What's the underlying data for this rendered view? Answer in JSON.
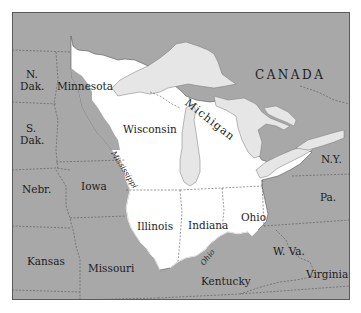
{
  "map": {
    "colors": {
      "outside_region": "#a8a8a8",
      "highlight_region": "#ffffff",
      "water": "#e6e6e6",
      "border": "#4a4a4a",
      "frame": "#5a5a5a"
    },
    "country_label": "CANADA",
    "lake_label": "Michigan",
    "highlighted_states": [
      {
        "id": "minnesota",
        "label": "Minnesota"
      },
      {
        "id": "wisconsin",
        "label": "Wisconsin"
      },
      {
        "id": "illinois",
        "label": "Illinois"
      },
      {
        "id": "indiana",
        "label": "Indiana"
      },
      {
        "id": "ohio",
        "label": "Ohio"
      }
    ],
    "other_states": [
      {
        "id": "north-dakota",
        "label_line1": "N.",
        "label_line2": "Dak."
      },
      {
        "id": "south-dakota",
        "label_line1": "S.",
        "label_line2": "Dak."
      },
      {
        "id": "nebraska",
        "label": "Nebr."
      },
      {
        "id": "iowa",
        "label": "Iowa"
      },
      {
        "id": "kansas",
        "label": "Kansas"
      },
      {
        "id": "missouri",
        "label": "Missouri"
      },
      {
        "id": "kentucky",
        "label": "Kentucky"
      },
      {
        "id": "west-virginia",
        "label": "W. Va."
      },
      {
        "id": "virginia",
        "label": "Virginia"
      },
      {
        "id": "pennsylvania",
        "label": "Pa."
      },
      {
        "id": "new-york",
        "label": "N.Y."
      }
    ],
    "rivers": [
      {
        "id": "mississippi",
        "label": "Mississippi"
      },
      {
        "id": "ohio-river",
        "label": "Ohio"
      }
    ]
  }
}
